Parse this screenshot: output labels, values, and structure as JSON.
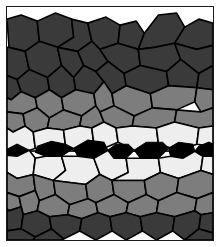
{
  "figure": {
    "width": 220,
    "height": 247
  },
  "frame": {
    "border_color": "#1a1a1a",
    "border_width": 1,
    "background": "#ffffff",
    "margin": 6
  },
  "palette": {
    "background": "#ffffff",
    "grain_boundary": "#000000",
    "dark_grain": "#3a3a3a",
    "medium_grain": "#7d7d7d",
    "light_grain": "#eeeeee",
    "inclusion": "#000000"
  },
  "chart_data": {
    "type": "diagram",
    "bands": [
      {
        "name": "upper-matrix",
        "tone": "dark",
        "fill": "#3a3a3a",
        "y_range": [
          12,
          78
        ],
        "label": "Coarse dark grains (upper matrix)"
      },
      {
        "name": "upper-transition",
        "tone": "medium",
        "fill": "#7d7d7d",
        "y_range": [
          74,
          106
        ],
        "label": "Medium-tone transition grains"
      },
      {
        "name": "upper-light",
        "tone": "light",
        "fill": "#eeeeee",
        "y_range": [
          100,
          124
        ],
        "label": "Light grains above centerline"
      },
      {
        "name": "centerline-inclusions",
        "tone": "black",
        "fill": "#000000",
        "y_range": [
          118,
          132
        ],
        "label": "Lenticular inclusion array"
      },
      {
        "name": "lower-light",
        "tone": "light",
        "fill": "#eeeeee",
        "y_range": [
          128,
          156
        ],
        "label": "Light grains below centerline"
      },
      {
        "name": "lower-transition",
        "tone": "medium",
        "fill": "#7d7d7d",
        "y_range": [
          150,
          184
        ],
        "label": "Medium-tone transition grains"
      },
      {
        "name": "lower-matrix",
        "tone": "dark",
        "fill": "#3a3a3a",
        "y_range": [
          178,
          232
        ],
        "label": "Coarse dark grains (lower matrix)"
      }
    ],
    "inclusion_centerline_y": 125,
    "inclusion_count": 9,
    "grain_count_estimate": 168
  },
  "icons": {
    "figure_frame": "rectangle-frame-icon"
  }
}
